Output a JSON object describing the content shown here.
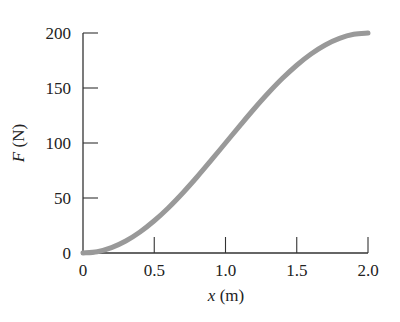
{
  "chart_data": {
    "type": "line",
    "title": "",
    "xlabel_var": "x",
    "xlabel_unit": " (m)",
    "ylabel_var": "F",
    "ylabel_unit": " (N)",
    "xlim": [
      0,
      2.0
    ],
    "ylim": [
      0,
      200
    ],
    "xticks": [
      0,
      0.5,
      1.0,
      1.5,
      2.0
    ],
    "xtick_labels": [
      "0",
      "0.5",
      "1.0",
      "1.5",
      "2.0"
    ],
    "yticks": [
      0,
      50,
      100,
      150,
      200
    ],
    "ytick_labels": [
      "0",
      "50",
      "100",
      "150",
      "200"
    ],
    "grid": false,
    "legend": null,
    "series": [
      {
        "name": "F(x)",
        "color": "#999999",
        "x": [
          0,
          0.1,
          0.2,
          0.3,
          0.4,
          0.5,
          0.6,
          0.7,
          0.8,
          0.9,
          1.0,
          1.1,
          1.2,
          1.3,
          1.4,
          1.5,
          1.6,
          1.7,
          1.8,
          1.9,
          2.0
        ],
        "values": [
          0,
          1.2,
          4.9,
          10.9,
          19.1,
          29.3,
          41.2,
          54.6,
          69.1,
          84.4,
          100,
          115.6,
          130.9,
          145.4,
          158.8,
          170.7,
          180.9,
          189.1,
          195.1,
          198.8,
          200
        ]
      }
    ]
  }
}
